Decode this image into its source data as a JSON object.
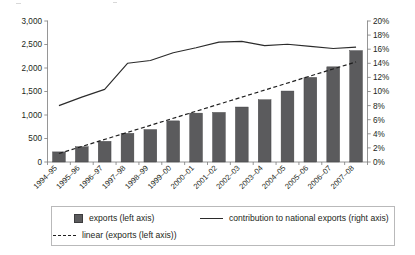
{
  "chart_data": {
    "type": "bar",
    "title": "",
    "subtitle": "",
    "xlabel": "",
    "ylabel": "",
    "categories": [
      "1994–95",
      "1995–96",
      "1996–97",
      "1997–98",
      "1998–99",
      "1999–00",
      "2000–01",
      "2001–02",
      "2002–03",
      "2003–04",
      "2004–05",
      "2005–06",
      "2006–07",
      "2007–08"
    ],
    "grid": false,
    "legend_position": "bottom",
    "axes": {
      "left": {
        "label": "",
        "ylim": [
          0,
          3000
        ],
        "ticks": [
          0,
          500,
          1000,
          1500,
          2000,
          2500,
          3000
        ],
        "tick_labels": [
          "0",
          "500",
          "1,000",
          "1,500",
          "2,000",
          "2,500",
          "3,000"
        ]
      },
      "right": {
        "label": "",
        "ylim": [
          0,
          20
        ],
        "ticks": [
          0,
          2,
          4,
          6,
          8,
          10,
          12,
          14,
          16,
          18,
          20
        ],
        "tick_labels": [
          "0%",
          "2%",
          "4%",
          "6%",
          "8%",
          "10%",
          "12%",
          "14%",
          "16%",
          "18%",
          "20%"
        ]
      }
    },
    "series": [
      {
        "name": "exports (left axis)",
        "type": "bar",
        "axis": "left",
        "color": "#5b5b5d",
        "values": [
          215,
          325,
          440,
          610,
          690,
          875,
          1040,
          1055,
          1170,
          1325,
          1510,
          1800,
          2025,
          2370
        ]
      },
      {
        "name": "contribution to national exports (right axis)",
        "type": "line",
        "axis": "right",
        "color": "#2b2b2b",
        "values": [
          8.0,
          9.2,
          10.3,
          14.0,
          14.4,
          15.5,
          16.2,
          17.0,
          17.1,
          16.5,
          16.7,
          16.4,
          16.1,
          16.3
        ]
      },
      {
        "name": "linear (exports (left axis))",
        "type": "trendline",
        "axis": "left",
        "color": "#1f1f1f",
        "dashed": true,
        "values": [
          180,
          330,
          480,
          630,
          780,
          930,
          1080,
          1230,
          1380,
          1530,
          1680,
          1830,
          1980,
          2130
        ]
      }
    ]
  },
  "legend": {
    "entries": [
      {
        "label": "exports (left axis)",
        "marker": "square-swatch"
      },
      {
        "label": "contribution to national exports (right axis)",
        "marker": "solid-line-swatch"
      },
      {
        "label": "linear (exports (left axis))",
        "marker": "dashed-line-swatch"
      }
    ]
  }
}
